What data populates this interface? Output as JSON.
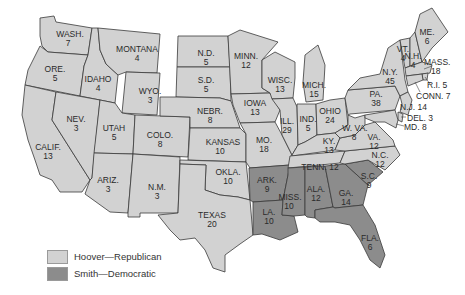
{
  "map": {
    "colors": {
      "hoover_republican": "#d2d2d2",
      "smith_democratic": "#8c8c8c",
      "border": "#3a3a3a"
    },
    "states": [
      {
        "abbr": "WASH.",
        "votes": "7",
        "party": "rep"
      },
      {
        "abbr": "ORE.",
        "votes": "5",
        "party": "rep"
      },
      {
        "abbr": "CALIF.",
        "votes": "13",
        "party": "rep"
      },
      {
        "abbr": "IDAHO",
        "votes": "4",
        "party": "rep"
      },
      {
        "abbr": "NEV.",
        "votes": "3",
        "party": "rep"
      },
      {
        "abbr": "MONTANA",
        "votes": "4",
        "party": "rep"
      },
      {
        "abbr": "WYO.",
        "votes": "3",
        "party": "rep"
      },
      {
        "abbr": "UTAH",
        "votes": "5",
        "party": "rep"
      },
      {
        "abbr": "ARIZ.",
        "votes": "3",
        "party": "rep"
      },
      {
        "abbr": "COLO.",
        "votes": "8",
        "party": "rep"
      },
      {
        "abbr": "N.M.",
        "votes": "3",
        "party": "rep"
      },
      {
        "abbr": "N.D.",
        "votes": "5",
        "party": "rep"
      },
      {
        "abbr": "S.D.",
        "votes": "5",
        "party": "rep"
      },
      {
        "abbr": "NEBR.",
        "votes": "8",
        "party": "rep"
      },
      {
        "abbr": "KANSAS",
        "votes": "10",
        "party": "rep"
      },
      {
        "abbr": "OKLA.",
        "votes": "10",
        "party": "rep"
      },
      {
        "abbr": "TEXAS",
        "votes": "20",
        "party": "rep"
      },
      {
        "abbr": "MINN.",
        "votes": "12",
        "party": "rep"
      },
      {
        "abbr": "IOWA",
        "votes": "13",
        "party": "rep"
      },
      {
        "abbr": "MO.",
        "votes": "18",
        "party": "rep"
      },
      {
        "abbr": "ARK.",
        "votes": "9",
        "party": "dem"
      },
      {
        "abbr": "LA.",
        "votes": "10",
        "party": "dem"
      },
      {
        "abbr": "WISC.",
        "votes": "13",
        "party": "rep"
      },
      {
        "abbr": "ILL.",
        "votes": "29",
        "party": "rep"
      },
      {
        "abbr": "MICH.",
        "votes": "15",
        "party": "rep"
      },
      {
        "abbr": "IND.",
        "votes": "5",
        "party": "rep"
      },
      {
        "abbr": "OHIO",
        "votes": "24",
        "party": "rep"
      },
      {
        "abbr": "KY.",
        "votes": "13",
        "party": "rep"
      },
      {
        "abbr": "TENN.",
        "votes": "12",
        "party": "rep"
      },
      {
        "abbr": "MISS.",
        "votes": "10",
        "party": "dem"
      },
      {
        "abbr": "ALA.",
        "votes": "12",
        "party": "dem"
      },
      {
        "abbr": "GA.",
        "votes": "14",
        "party": "dem"
      },
      {
        "abbr": "FLA.",
        "votes": "6",
        "party": "rep"
      },
      {
        "abbr": "S.C.",
        "votes": "9",
        "party": "dem"
      },
      {
        "abbr": "N.C.",
        "votes": "12",
        "party": "rep"
      },
      {
        "abbr": "VA.",
        "votes": "12",
        "party": "rep"
      },
      {
        "abbr": "W. VA.",
        "votes": "8",
        "party": "rep"
      },
      {
        "abbr": "PA.",
        "votes": "38",
        "party": "rep"
      },
      {
        "abbr": "N.Y.",
        "votes": "45",
        "party": "rep"
      },
      {
        "abbr": "VT.",
        "votes": "4",
        "party": "rep"
      },
      {
        "abbr": "N.H.",
        "votes": "4",
        "party": "rep"
      },
      {
        "abbr": "ME.",
        "votes": "6",
        "party": "rep"
      },
      {
        "abbr": "MASS.",
        "votes": "18",
        "party": "rep"
      },
      {
        "abbr": "R.I.",
        "votes": "5",
        "party": "rep"
      },
      {
        "abbr": "CONN.",
        "votes": "7",
        "party": "rep"
      },
      {
        "abbr": "N.J.",
        "votes": "14",
        "party": "rep"
      },
      {
        "abbr": "DEL.",
        "votes": "3",
        "party": "rep"
      },
      {
        "abbr": "MD.",
        "votes": "8",
        "party": "rep"
      }
    ],
    "labels": {
      "wash": "WASH.",
      "wash_v": "7",
      "ore": "ORE.",
      "ore_v": "5",
      "calif": "CALIF.",
      "calif_v": "13",
      "idaho": "IDAHO",
      "idaho_v": "4",
      "nev": "NEV.",
      "nev_v": "3",
      "mont": "MONTANA",
      "mont_v": "4",
      "wyo": "WYO.",
      "wyo_v": "3",
      "utah": "UTAH",
      "utah_v": "5",
      "ariz": "ARIZ.",
      "ariz_v": "3",
      "colo": "COLO.",
      "colo_v": "8",
      "nm": "N.M.",
      "nm_v": "3",
      "nd": "N.D.",
      "nd_v": "5",
      "sd": "S.D.",
      "sd_v": "5",
      "nebr": "NEBR.",
      "nebr_v": "8",
      "kans": "KANSAS",
      "kans_v": "10",
      "okla": "OKLA.",
      "okla_v": "10",
      "tex": "TEXAS",
      "tex_v": "20",
      "minn": "MINN.",
      "minn_v": "12",
      "iowa": "IOWA",
      "iowa_v": "13",
      "mo": "MO.",
      "mo_v": "18",
      "ark": "ARK.",
      "ark_v": "9",
      "la": "LA.",
      "la_v": "10",
      "wisc": "WISC.",
      "wisc_v": "13",
      "ill": "ILL.",
      "ill_v": "29",
      "mich": "MICH.",
      "mich_v": "15",
      "ind": "IND.",
      "ind_v": "5",
      "ohio": "OHIO",
      "ohio_v": "24",
      "ky": "KY.",
      "ky_v": "13",
      "tenn": "TENN. 12",
      "miss": "MISS.",
      "miss_v": "10",
      "ala": "ALA.",
      "ala_v": "12",
      "ga": "GA.",
      "ga_v": "14",
      "fla": "FLA.",
      "fla_v": "6",
      "sc": "S.C.",
      "sc_v": "9",
      "nc": "N.C.",
      "nc_v": "12",
      "va": "VA.",
      "va_v": "12",
      "wva": "W. VA.",
      "wva_v": "8",
      "pa": "PA.",
      "pa_v": "38",
      "ny": "N.Y.",
      "ny_v": "45",
      "vt": "VT.",
      "vt_v": "4",
      "nh": "N.H.",
      "nh_v": "4",
      "me": "ME.",
      "me_v": "6",
      "mass": "MASS.",
      "mass_v": "18",
      "ri": "R.I. 5",
      "conn": "CONN. 7",
      "nj": "N.J. 14",
      "del": "DEL. 3",
      "md": "MD. 8"
    }
  },
  "legend": {
    "items": [
      {
        "label": "Hoover—Republican",
        "color": "#d2d2d2"
      },
      {
        "label": "Smith—Democratic",
        "color": "#8c8c8c"
      }
    ]
  }
}
